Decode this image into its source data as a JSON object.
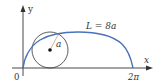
{
  "figure": {
    "type": "cycloid-arc-length",
    "axes": {
      "x_label": "x",
      "y_label": "y",
      "origin_label": "0",
      "x_end_label": "2π"
    },
    "curve": {
      "name": "cycloid",
      "label": "L = 8a",
      "color": "#4a72b8"
    },
    "circle": {
      "radius_label": "a",
      "color": "#333333"
    }
  }
}
